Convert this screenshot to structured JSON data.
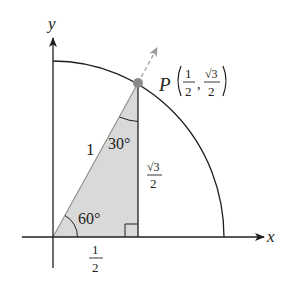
{
  "diagram": {
    "axes": {
      "x_label": "x",
      "y_label": "y"
    },
    "point": {
      "name": "P",
      "x_num": "1",
      "x_den": "2",
      "y_num": "√3",
      "y_den": "2",
      "comma": ","
    },
    "triangle": {
      "hypotenuse_label": "1",
      "angle_top": "30°",
      "angle_origin": "60°",
      "vertical_num": "√3",
      "vertical_den": "2",
      "horizontal_num": "1",
      "horizontal_den": "2"
    },
    "colors": {
      "fill": "#d9d9d9",
      "line": "#231f20",
      "point": "#8a8a8a",
      "dashed": "#9a9a9a"
    }
  }
}
